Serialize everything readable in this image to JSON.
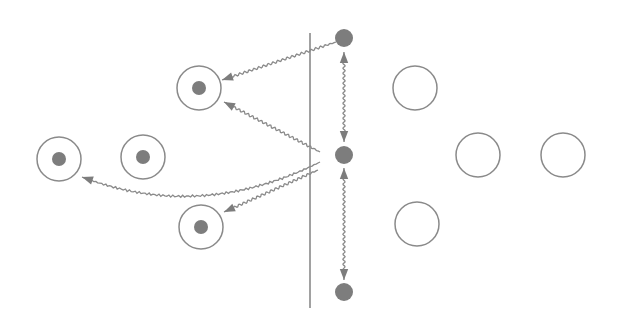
{
  "diagram": {
    "colors": {
      "stroke": "#8a8a8a",
      "fill_dot": "#7d7d7d",
      "background": "#ffffff"
    },
    "boundary_line": {
      "x": 310,
      "y1": 33,
      "y2": 308
    },
    "boundary_dots": [
      {
        "id": "top",
        "cx": 344,
        "cy": 38,
        "r": 9
      },
      {
        "id": "middle",
        "cx": 344,
        "cy": 155,
        "r": 9
      },
      {
        "id": "bottom",
        "cx": 344,
        "cy": 292,
        "r": 9
      }
    ],
    "ringed_cells": [
      {
        "id": "upper",
        "cx": 199,
        "cy": 88,
        "r": 22,
        "nucleus_r": 7
      },
      {
        "id": "far-left",
        "cx": 59,
        "cy": 159,
        "r": 22,
        "nucleus_r": 7
      },
      {
        "id": "center-left",
        "cx": 143,
        "cy": 157,
        "r": 22,
        "nucleus_r": 7
      },
      {
        "id": "lower",
        "cx": 201,
        "cy": 227,
        "r": 22,
        "nucleus_r": 7
      }
    ],
    "empty_circles": [
      {
        "id": "upper",
        "cx": 415,
        "cy": 88,
        "r": 22
      },
      {
        "id": "middle-left",
        "cx": 478,
        "cy": 155,
        "r": 22
      },
      {
        "id": "middle-right",
        "cx": 563,
        "cy": 155,
        "r": 22
      },
      {
        "id": "lower",
        "cx": 417,
        "cy": 224,
        "r": 22
      }
    ],
    "arrows": [
      {
        "id": "top-dot-to-upper-cell",
        "from": [
          336,
          42
        ],
        "to": [
          222,
          80
        ],
        "type": "wavy",
        "head": "end"
      },
      {
        "id": "middle-dot-to-upper-cell",
        "from": [
          320,
          152
        ],
        "to": [
          224,
          102
        ],
        "type": "wavy",
        "head": "end"
      },
      {
        "id": "middle-dot-to-far-left-cell",
        "from": [
          320,
          162
        ],
        "to": [
          82,
          177
        ],
        "type": "wavy-curve",
        "head": "end"
      },
      {
        "id": "middle-dot-to-lower-cell",
        "from": [
          318,
          170
        ],
        "to": [
          224,
          212
        ],
        "type": "wavy",
        "head": "end"
      },
      {
        "id": "top-middle-link",
        "from": [
          344,
          52
        ],
        "to": [
          344,
          142
        ],
        "type": "wavy",
        "head": "both"
      },
      {
        "id": "middle-bottom-link",
        "from": [
          344,
          168
        ],
        "to": [
          344,
          280
        ],
        "type": "wavy",
        "head": "both"
      }
    ]
  }
}
